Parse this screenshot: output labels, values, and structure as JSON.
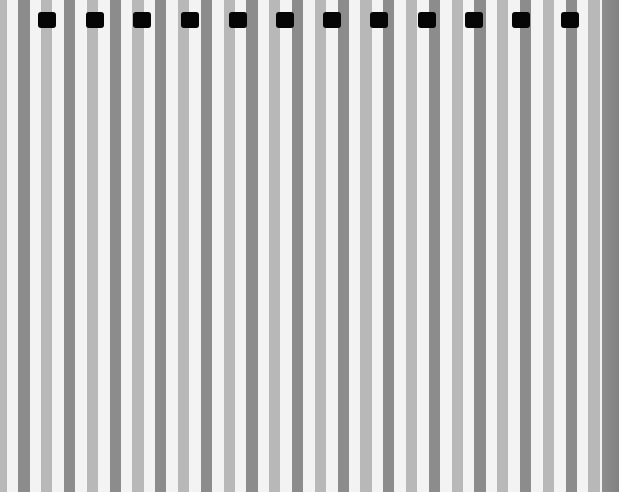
{
  "image": {
    "description": "Close-up photo of a vertically striped surface with alternating light gray, white and dark gray bands, and a row of small black rectangular tabs along the top",
    "colors": {
      "white_band": "#f3f3f3",
      "light_band": "#b8b8b8",
      "dark_band": "#8c8c8c",
      "tab": "#050505",
      "right_edge": "#888888"
    },
    "stripe_period_px": 45.6,
    "stripe_width_px": 11.4,
    "tab_count": 12,
    "tab_positions_x": [
      38,
      86,
      133,
      181,
      229,
      276,
      323,
      370,
      418,
      465,
      512,
      561
    ],
    "tab_size": {
      "width": 18,
      "height": 16,
      "top": 12
    }
  }
}
